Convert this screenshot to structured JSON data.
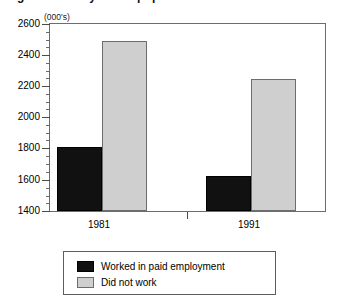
{
  "chart_data": {
    "type": "bar",
    "title": "Figure: Activity of the population",
    "units_label": "(000's)",
    "categories": [
      "1981",
      "1991"
    ],
    "series": [
      {
        "name": "Worked in paid employment",
        "color": "#111111",
        "values": [
          1810,
          1625
        ]
      },
      {
        "name": "Did not work",
        "color": "#cfcfcf",
        "values": [
          2490,
          2245
        ]
      }
    ],
    "xlabel": "",
    "ylabel": "",
    "ylim": [
      1400,
      2600
    ],
    "ytick_step": 200,
    "yticks": [
      1400,
      1600,
      1800,
      2000,
      2200,
      2400,
      2600
    ],
    "minor_tick_step": 50,
    "grid": false,
    "legend_position": "bottom"
  },
  "legend": {
    "items": [
      {
        "label": "Worked in paid employment",
        "swatch": "dark"
      },
      {
        "label": "Did not work",
        "swatch": "light"
      }
    ]
  },
  "axis": {
    "tick_labels": [
      "2600",
      "2400",
      "2200",
      "2000",
      "1800",
      "1600",
      "1400"
    ],
    "x_labels": [
      "1981",
      "1991"
    ]
  }
}
